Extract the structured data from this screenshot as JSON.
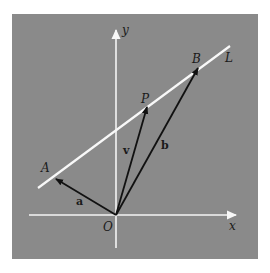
{
  "colors": {
    "background": "#ffffff",
    "panel": "#8a8a8a",
    "axes": "#f4f4f4",
    "line_L": "#f8f8f8",
    "vectors": "#111111",
    "text": "#1a1a1a"
  },
  "axes": {
    "x_label": "x",
    "y_label": "y",
    "origin_label": "O"
  },
  "line": {
    "label": "L"
  },
  "points": {
    "A": "A",
    "P": "P",
    "B": "B"
  },
  "vectors": {
    "a": "a",
    "v": "v",
    "b": "b"
  }
}
